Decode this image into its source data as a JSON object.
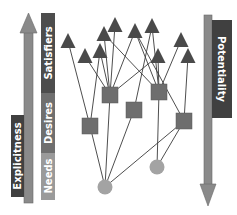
{
  "left_axis": {
    "arrow_label": "Explicitness",
    "direction": "up",
    "segments": [
      {
        "label": "Satisfiers",
        "color": "#4d4d4d"
      },
      {
        "label": "Desires",
        "color": "#6f6f6f"
      },
      {
        "label": "Needs",
        "color": "#9a9a9a"
      }
    ],
    "arrow_color": "#8a8a8a",
    "label_box_color": "#404040"
  },
  "right_axis": {
    "arrow_label": "Potentiality",
    "direction": "down",
    "arrow_color": "#8a8a8a",
    "label_box_color": "#404040"
  },
  "graph": {
    "layers": [
      {
        "name": "satisfiers",
        "shape": "triangle",
        "color": "#4a4a4a"
      },
      {
        "name": "desires",
        "shape": "square",
        "color": "#6e6e6e"
      },
      {
        "name": "needs",
        "shape": "circle",
        "color": "#a3a3a3"
      }
    ],
    "node_counts": {
      "triangles": 10,
      "squares": 5,
      "circles": 2
    },
    "edges": [
      [
        "T1",
        "S4"
      ],
      [
        "T2",
        "S1"
      ],
      [
        "T3",
        "S1"
      ],
      [
        "T3",
        "S4"
      ],
      [
        "T4",
        "S1"
      ],
      [
        "T4",
        "S2"
      ],
      [
        "T5",
        "S1"
      ],
      [
        "T6",
        "S1"
      ],
      [
        "T6",
        "S2"
      ],
      [
        "T6",
        "S5"
      ],
      [
        "T7",
        "S3"
      ],
      [
        "T7",
        "S2"
      ],
      [
        "T8",
        "S1"
      ],
      [
        "T8",
        "S2"
      ],
      [
        "T9",
        "S2"
      ],
      [
        "T10",
        "S5"
      ],
      [
        "S4",
        "C1"
      ],
      [
        "S1",
        "C1"
      ],
      [
        "S3",
        "C1"
      ],
      [
        "S5",
        "C1"
      ],
      [
        "S2",
        "C2"
      ],
      [
        "S5",
        "C2"
      ]
    ]
  }
}
